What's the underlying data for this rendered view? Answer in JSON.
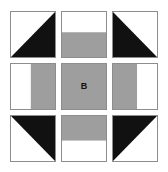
{
  "diagram": {
    "grid": {
      "rows": 3,
      "columns": 3
    },
    "colors": {
      "background": "#ffffff",
      "light": "#ffffff",
      "medium": "#9e9e9e",
      "dark": "#111111",
      "outline": "#8d8d8d"
    },
    "cells": [
      {
        "id": "cell-r1c1",
        "position": "top-left",
        "pattern": "half-square-triangle",
        "dark_corner": "bottom-right",
        "label": ""
      },
      {
        "id": "cell-r1c2",
        "position": "top-center",
        "pattern": "horizontal-split",
        "top_color": "light",
        "bottom_color": "medium",
        "split_ratio": 0.45,
        "label": ""
      },
      {
        "id": "cell-r1c3",
        "position": "top-right",
        "pattern": "half-square-triangle",
        "dark_corner": "bottom-left",
        "label": ""
      },
      {
        "id": "cell-r2c1",
        "position": "middle-left",
        "pattern": "vertical-split",
        "left_color": "light",
        "right_color": "medium",
        "split_ratio": 0.45,
        "label": ""
      },
      {
        "id": "cell-r2c2",
        "position": "center",
        "pattern": "solid",
        "fill_color": "medium",
        "label": "B"
      },
      {
        "id": "cell-r2c3",
        "position": "middle-right",
        "pattern": "vertical-split",
        "left_color": "medium",
        "right_color": "light",
        "split_ratio": 0.55,
        "label": ""
      },
      {
        "id": "cell-r3c1",
        "position": "bottom-left",
        "pattern": "half-square-triangle",
        "dark_corner": "top-right",
        "label": ""
      },
      {
        "id": "cell-r3c2",
        "position": "bottom-center",
        "pattern": "horizontal-split",
        "top_color": "medium",
        "bottom_color": "light",
        "split_ratio": 0.55,
        "label": ""
      },
      {
        "id": "cell-r3c3",
        "position": "bottom-right",
        "pattern": "half-square-triangle",
        "dark_corner": "top-left",
        "label": ""
      }
    ]
  }
}
